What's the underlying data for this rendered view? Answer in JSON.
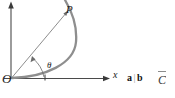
{
  "figure": {
    "type": "math-diagram",
    "axes": {
      "origin_label": "O",
      "x_axis_label": "x",
      "y_axis_label": "",
      "x_axis_arrow": "right",
      "y_axis_arrow": "up",
      "tick_on_x_axis": true
    },
    "points": {
      "P": "P"
    },
    "angle": {
      "symbol": "θ"
    },
    "curve": {
      "stroke_color": "#8e8e8e",
      "stroke_width": 2.2
    },
    "ray": {
      "stroke_color": "#6b6b6b",
      "stroke_width": 0.8
    }
  },
  "side_text": {
    "bold_tokens": "a b",
    "separator": "|",
    "a": "a",
    "b": "b",
    "edge_fragment": "C"
  },
  "colors": {
    "axis": "#4a4a4a",
    "curve": "#8e8e8e",
    "ray": "#707070",
    "text": "#1a1a1a",
    "background": "#ffffff"
  }
}
